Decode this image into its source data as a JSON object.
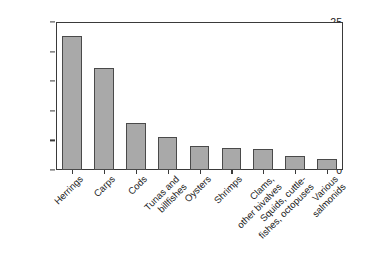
{
  "chart_data": {
    "type": "bar",
    "title": "",
    "xlabel": "",
    "ylabel": "Million tons",
    "ylim": [
      0,
      25
    ],
    "yticks": [
      0,
      5,
      10,
      15,
      20,
      25
    ],
    "grid": false,
    "legend": null,
    "categories": [
      "Herrings",
      "Carps",
      "Cods",
      "Tunas and\nbillfishes",
      "Oysters",
      "Shrimps",
      "Clams,\nother bivalves",
      "Squids, cuttle-\nfishes, octopuses",
      "Various\nsalmonids"
    ],
    "values": [
      22.6,
      17.2,
      8.0,
      5.6,
      4.0,
      3.7,
      3.6,
      2.4,
      1.8
    ],
    "bar_color": "#a9a9a9",
    "bar_edge_color": "#4a4a4a",
    "axis_color": "#3a3a3a",
    "background_color": "#ffffff"
  }
}
